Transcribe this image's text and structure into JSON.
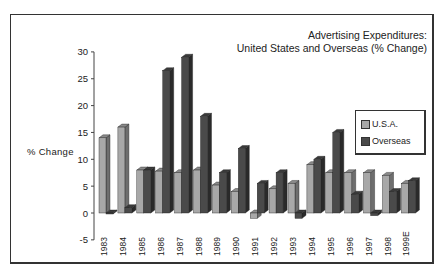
{
  "chart_data": {
    "type": "bar",
    "title": "Advertising Expenditures:",
    "subtitle": "United States and Overseas (% Change)",
    "xlabel": "",
    "ylabel": "% Change",
    "ylim": [
      -5,
      30
    ],
    "yticks": [
      -5,
      0,
      5,
      10,
      15,
      20,
      25,
      30
    ],
    "grid": false,
    "legend_position": "right",
    "style": "3d-clustered",
    "categories": [
      "1983",
      "1984",
      "1985",
      "1986",
      "1987",
      "1988",
      "1989",
      "1990",
      "1991",
      "1992",
      "1993",
      "1994",
      "1995",
      "1996",
      "1997",
      "1998",
      "1999E"
    ],
    "series": [
      {
        "name": "U.S.A.",
        "color": "#a8a8a8",
        "values": [
          14,
          16,
          8,
          7.8,
          7.5,
          8,
          5.2,
          4,
          -1,
          4.5,
          5.5,
          9,
          7.5,
          7.5,
          7.5,
          7,
          5.5
        ]
      },
      {
        "name": "Overseas",
        "color": "#4a4a4a",
        "values": [
          0,
          1,
          8,
          26.5,
          29,
          18,
          7.5,
          12,
          5.5,
          7.5,
          -1,
          10,
          15,
          3.5,
          -0.5,
          4,
          6
        ]
      }
    ]
  },
  "labels": {
    "title_line1": "Advertising Expenditures:",
    "title_line2": "United States and Overseas (% Change)",
    "ylabel": "% Change",
    "legend_usa": "U.S.A.",
    "legend_overseas": "Overseas"
  }
}
